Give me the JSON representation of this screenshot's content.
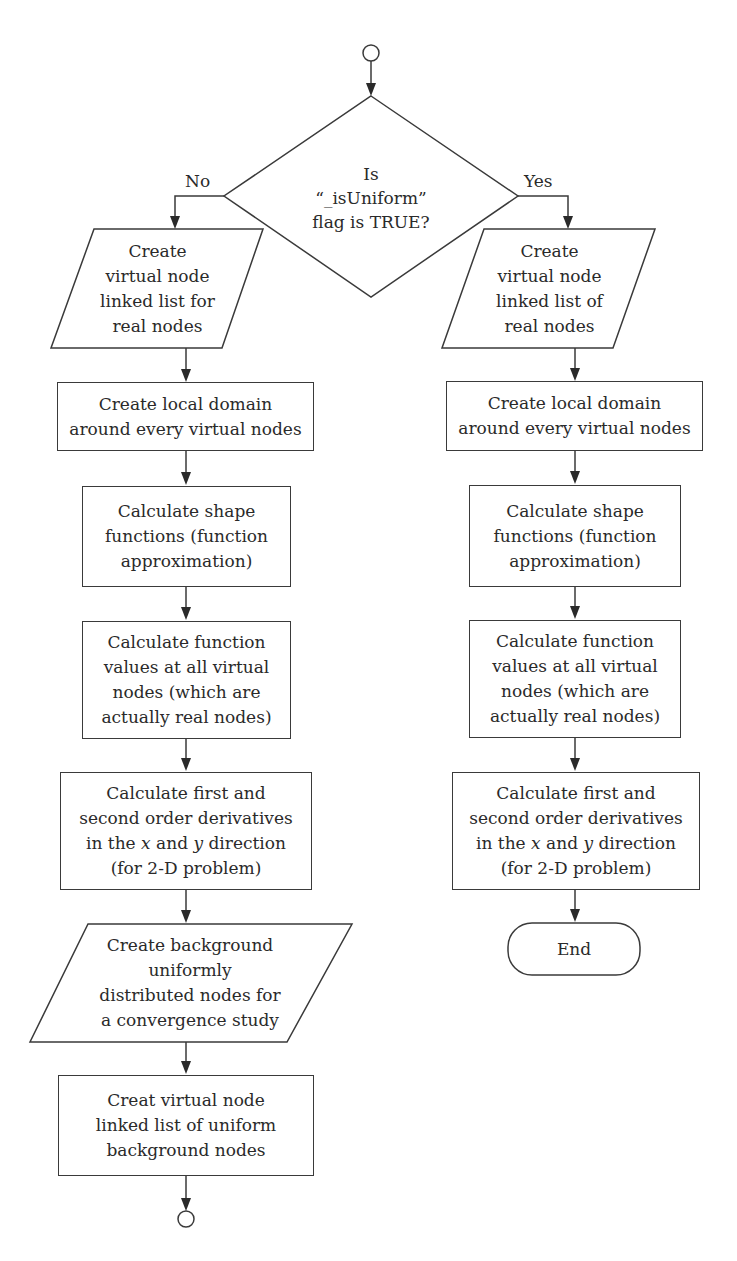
{
  "diagram": {
    "type": "flowchart",
    "start_connector": "circle",
    "decision": {
      "id": "is-uniform",
      "text": "Is\n“_isUniform”\nflag is TRUE?"
    },
    "branches": {
      "no_label": "No",
      "yes_label": "Yes"
    },
    "left_column": [
      {
        "shape": "parallelogram",
        "text": "Create\nvirtual node\nlinked list for\nreal nodes"
      },
      {
        "shape": "rectangle",
        "text": "Create local domain\naround every virtual nodes"
      },
      {
        "shape": "rectangle",
        "text": "Calculate shape\nfunctions (function\napproximation)"
      },
      {
        "shape": "rectangle",
        "text": "Calculate function\nvalues at all virtual\nnodes (which are\nactually real nodes)"
      },
      {
        "shape": "rectangle",
        "line1": "Calculate first and",
        "line2": "second order derivatives",
        "line3_pre": "in the ",
        "var_x": "x",
        "line3_mid": " and ",
        "var_y": "y",
        "line3_post": " direction",
        "line4": "(for 2-D problem)"
      },
      {
        "shape": "parallelogram",
        "text": "Create background\nuniformly\ndistributed nodes for\na convergence study"
      },
      {
        "shape": "rectangle",
        "text": "Creat virtual node\nlinked list of uniform\nbackground nodes"
      }
    ],
    "left_end_connector": "circle",
    "right_column": [
      {
        "shape": "parallelogram",
        "text": "Create\nvirtual node\nlinked list of\nreal nodes"
      },
      {
        "shape": "rectangle",
        "text": "Create local domain\naround every virtual nodes"
      },
      {
        "shape": "rectangle",
        "text": "Calculate shape\nfunctions (function\napproximation)"
      },
      {
        "shape": "rectangle",
        "text": "Calculate function\nvalues at all virtual\nnodes (which are\nactually real nodes)"
      },
      {
        "shape": "rectangle",
        "line1": "Calculate first and",
        "line2": "second order derivatives",
        "line3_pre": "in the ",
        "var_x": "x",
        "line3_mid": " and ",
        "var_y": "y",
        "line3_post": " direction",
        "line4": "(for 2-D problem)"
      }
    ],
    "terminator": {
      "shape": "rounded-rectangle",
      "text": "End"
    },
    "colors": {
      "stroke": "#3a3a3a",
      "text": "#2a2a2a",
      "background": "#ffffff"
    }
  }
}
